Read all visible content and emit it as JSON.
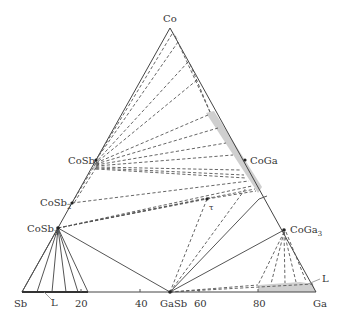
{
  "diagram": {
    "type": "ternary-phase-diagram",
    "system": "Co-Ga-Sb",
    "corners": {
      "top": "Co",
      "left": "Sb",
      "right": "Ga"
    },
    "phases": [
      {
        "id": "CoSb",
        "label": "CoSb"
      },
      {
        "id": "CoSb2",
        "label": "CoSb",
        "subscript": "2"
      },
      {
        "id": "CoSb3",
        "label": "CoSb",
        "subscript": "3"
      },
      {
        "id": "CoGa",
        "label": "CoGa"
      },
      {
        "id": "CoGa3",
        "label": "CoGa",
        "subscript": "3"
      },
      {
        "id": "GaSb",
        "label": "GaSb"
      },
      {
        "id": "tau",
        "label": "τ"
      }
    ],
    "liquid_labels": [
      {
        "id": "L-sb-side",
        "label": "L"
      },
      {
        "id": "L-ga-side",
        "label": "L"
      }
    ],
    "base_axis_ticks": [
      "20",
      "40",
      "60",
      "80"
    ],
    "colors": {
      "line": "#555555",
      "region_fill": "#cfcfcf",
      "text": "#333333"
    }
  }
}
